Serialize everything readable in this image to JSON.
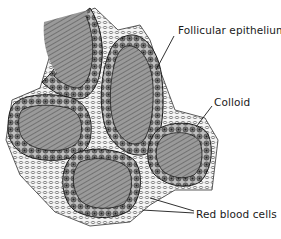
{
  "figure": {
    "labels": [
      {
        "id": "follicular-epithelium",
        "text": "Follicular epithelium",
        "x": 178,
        "y": 24
      },
      {
        "id": "colloid",
        "text": "Colloid",
        "x": 214,
        "y": 96
      },
      {
        "id": "red-blood-cells",
        "text": "Red blood cells",
        "x": 196,
        "y": 208
      }
    ],
    "colors": {
      "ink": "#1a1a1a",
      "colloid_fill": "#8a8a8a",
      "epithelium_fill": "#6e6e6e",
      "background": "#ffffff"
    }
  }
}
